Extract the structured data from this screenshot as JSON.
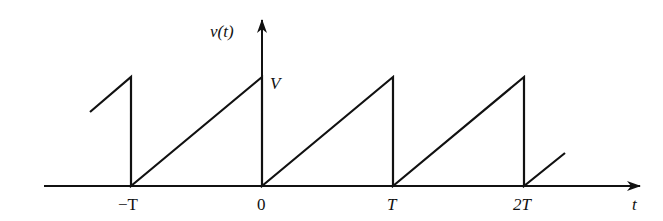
{
  "diagram": {
    "type": "sawtooth-waveform",
    "y_axis_label": "v(t)",
    "x_axis_label": "t",
    "amplitude_label": "V",
    "tick_labels": [
      "−T",
      "0",
      "T",
      "2T"
    ],
    "line_color": "#111111",
    "background": "#ffffff"
  },
  "geometry": {
    "origin_x": 262,
    "axis_y": 186,
    "period_px": 131,
    "peak_y": 77
  }
}
